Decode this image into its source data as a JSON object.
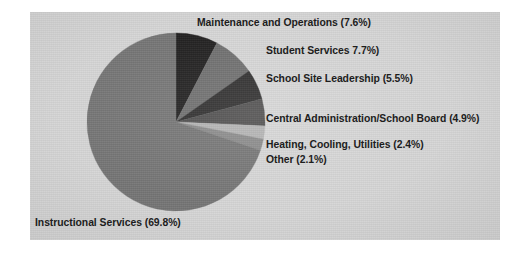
{
  "panel": {
    "background_color": "#d6d6d6",
    "label_color": "#1d1d1d"
  },
  "chart_data": {
    "type": "pie",
    "title": "",
    "subtitle": "",
    "xlabel": "",
    "ylabel": "",
    "legend_position": "none",
    "grid": false,
    "labels_inline": true,
    "start_angle_deg": 0,
    "direction": "clockwise",
    "unit": "percent",
    "total": 100.0,
    "categories": [
      "Maintenance and Operations",
      "Student Services",
      "School Site Leadership",
      "Central Administration/School Board",
      "Heating, Cooling, Utilities",
      "Other",
      "Instructional Services"
    ],
    "values": [
      7.6,
      7.7,
      5.5,
      4.9,
      2.4,
      2.1,
      69.8
    ],
    "colors": [
      "#201f1f",
      "#6e6e6e",
      "#2e2d2d",
      "#4f4e4e",
      "#b3b3b3",
      "#8a8a8a",
      "#757575"
    ],
    "slices": [
      {
        "name": "Maintenance and Operations",
        "label": "Maintenance and Operations (7.6%)",
        "value": 7.6,
        "color": "#201f1f"
      },
      {
        "name": "Student Services",
        "label": "Student Services 7.7%)",
        "value": 7.7,
        "color": "#6e6e6e"
      },
      {
        "name": "School Site Leadership",
        "label": "School Site Leadership (5.5%)",
        "value": 5.5,
        "color": "#2e2d2d"
      },
      {
        "name": "Central Administration/School Board",
        "label": "Central Administration/School Board (4.9%)",
        "value": 4.9,
        "color": "#4f4e4e"
      },
      {
        "name": "Heating, Cooling, Utilities",
        "label": "Heating, Cooling, Utilities (2.4%)",
        "value": 2.4,
        "color": "#b3b3b3"
      },
      {
        "name": "Other",
        "label": "Other (2.1%)",
        "value": 2.1,
        "color": "#8a8a8a"
      },
      {
        "name": "Instructional Services",
        "label": "Instructional Services (69.8%)",
        "value": 69.8,
        "color": "#757575"
      }
    ]
  }
}
